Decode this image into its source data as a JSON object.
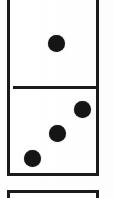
{
  "image": {
    "subject": "domino-tiles",
    "description": "Close-up of a domino tile photographed from above; the tile is cropped by the frame at the top, and the top edge of a second tile appears at the bottom.",
    "background_color": "#ffffff",
    "ink_color": "#1b1b1b",
    "pip_color": "#151515",
    "tile_face_color": "#ffffff",
    "width": 113,
    "height": 198
  },
  "tiles": [
    {
      "name": "main-domino-tile",
      "cropped_at_top": true,
      "left": 7,
      "top": -6,
      "width": 92,
      "height": 182,
      "border_width": 3,
      "cells": [
        {
          "name": "upper-half",
          "pip_count": 1,
          "value_label": "1",
          "pips": [
            {
              "cx": 53,
              "cy": 40,
              "d": 17
            }
          ]
        },
        {
          "name": "lower-half",
          "pip_count": 3,
          "value_label": "3",
          "pips": [
            {
              "cx": 79,
              "cy": 106,
              "d": 17
            },
            {
              "cx": 54,
              "cy": 130,
              "d": 17
            },
            {
              "cx": 29,
              "cy": 155,
              "d": 17
            }
          ]
        }
      ],
      "divider": {
        "left": 10,
        "top": 83,
        "width": 86,
        "height": 3
      }
    },
    {
      "name": "next-domino-tile",
      "cropped_at_bottom": true,
      "left": 7,
      "top": 190,
      "width": 92,
      "height": 30,
      "border_width": 3,
      "cells": [],
      "pip_count": 0
    }
  ],
  "readout": {
    "visible_tile_value": "1 | 3",
    "total_visible_pips": 4
  }
}
